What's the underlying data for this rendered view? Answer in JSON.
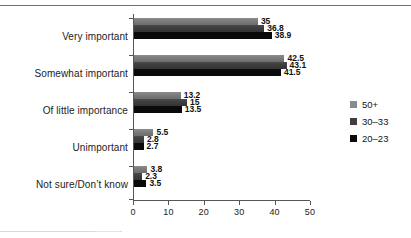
{
  "chart_data": {
    "type": "bar",
    "orientation": "horizontal",
    "title": "",
    "subtitle": "",
    "xlabel": "",
    "ylabel": "",
    "xlim": [
      0,
      50
    ],
    "xticks": [
      0,
      10,
      20,
      30,
      40,
      50
    ],
    "xticklabels": [
      "0",
      "10",
      "20",
      "30",
      "40",
      "50"
    ],
    "grid": false,
    "legend_position": "right",
    "categories": [
      "Very important",
      "Somewhat important",
      "Of little importance",
      "Unimportant",
      "Not sure/Don’t know"
    ],
    "series": [
      {
        "name": "50+",
        "color": "#8a8a8a",
        "values": [
          35,
          42.5,
          13.2,
          5.5,
          3.8
        ],
        "labels": [
          "35",
          "42.5",
          "13.2",
          "5.5",
          "3.8"
        ]
      },
      {
        "name": "30–33",
        "color": "#3f3f3f",
        "values": [
          36.8,
          43.1,
          15,
          2.8,
          2.3
        ],
        "labels": [
          "36.8",
          "43.1",
          "15",
          "2.8",
          "2.3"
        ]
      },
      {
        "name": "20–23",
        "color": "#0a0a0a",
        "values": [
          38.9,
          41.5,
          13.5,
          2.7,
          3.5
        ],
        "labels": [
          "38.9",
          "41.5",
          "13.5",
          "2.7",
          "3.5"
        ]
      }
    ]
  }
}
